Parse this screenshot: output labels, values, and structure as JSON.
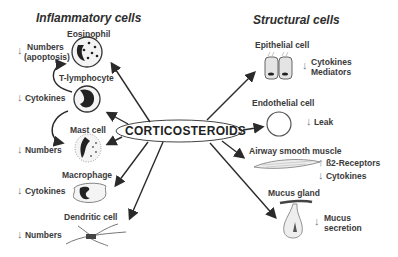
{
  "diagram": {
    "center": "CORTICOSTEROIDS",
    "left_title": "Inflammatory cells",
    "right_title": "Structural cells",
    "inflammatory_cells": [
      {
        "name": "Eosinophil",
        "effect_arrow": "↓",
        "effect": "Numbers",
        "effect2": "(apoptosis)"
      },
      {
        "name": "T-lymphocyte",
        "effect_arrow": "↓",
        "effect": "Cytokines"
      },
      {
        "name": "Mast cell",
        "effect_arrow": "↓",
        "effect": "Numbers"
      },
      {
        "name": "Macrophage",
        "effect_arrow": "↓",
        "effect": "Cytokines"
      },
      {
        "name": "Dendritic cell",
        "effect_arrow": "↓",
        "effect": "Numbers"
      }
    ],
    "structural_cells": [
      {
        "name": "Epithelial cell",
        "effect_arrow": "↓",
        "effect": "Cytokines",
        "effect2": "Mediators"
      },
      {
        "name": "Endothelial cell",
        "effect_arrow": "↓",
        "effect": "Leak"
      },
      {
        "name": "Airway smooth muscle",
        "effect_arrow_up": "↑",
        "effect": "ß2-Receptors",
        "effect_arrow": "↓",
        "effect2": "Cytokines"
      },
      {
        "name": "Mucus gland",
        "effect_arrow": "↓",
        "effect": "Mucus",
        "effect2": "secretion"
      }
    ]
  }
}
